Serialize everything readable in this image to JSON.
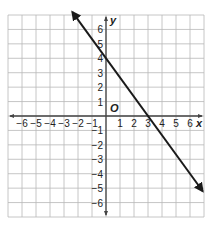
{
  "chart_data": {
    "type": "line",
    "title": "",
    "xlabel": "x",
    "ylabel": "y",
    "origin_label": "O",
    "xlim": [
      -7,
      7
    ],
    "ylim": [
      -7,
      7
    ],
    "grid": true,
    "x_ticks": [
      -6,
      -5,
      -4,
      -3,
      -2,
      -1,
      1,
      2,
      3,
      4,
      5,
      6
    ],
    "y_ticks": [
      6,
      5,
      4,
      3,
      2,
      1,
      -1,
      -2,
      -3,
      -4,
      -5,
      -6
    ],
    "series": [
      {
        "name": "line",
        "equation": "y = -4/3 x + 4",
        "slope": -1.3333,
        "y_intercept": 4,
        "x_intercept": 3,
        "x": [
          -2.4,
          6.9
        ],
        "y": [
          7.2,
          -5.2
        ],
        "arrows": "both",
        "color": "#1a1a1a"
      }
    ]
  },
  "colors": {
    "grid": "#b8b8b8",
    "axis": "#444444",
    "line": "#1a1a1a",
    "background": "#ffffff"
  }
}
